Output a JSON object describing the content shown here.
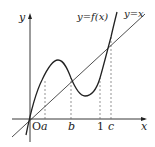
{
  "diagram": {
    "type": "function-graph",
    "axes": {
      "x_label": "x",
      "y_label": "y",
      "origin_label": "O"
    },
    "curves": [
      {
        "name": "cubic",
        "label": "y=f(x)"
      },
      {
        "name": "identity-line",
        "label": "y=x"
      }
    ],
    "x_ticks": [
      {
        "label": "a"
      },
      {
        "label": "b"
      },
      {
        "label": "1"
      },
      {
        "label": "c"
      }
    ],
    "colors": {
      "stroke": "#222222",
      "dashed": "#555555",
      "background": "#ffffff"
    }
  }
}
